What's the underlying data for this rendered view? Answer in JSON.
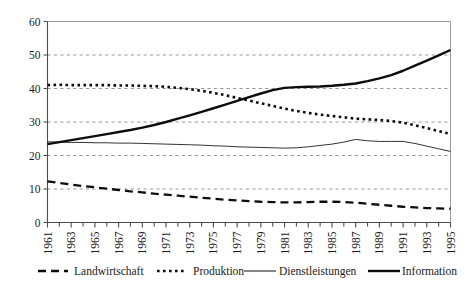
{
  "chart_data": {
    "type": "line",
    "title": "",
    "subtitle": "",
    "xlabel": "",
    "ylabel": "",
    "xlim": [
      1961,
      1995
    ],
    "ylim": [
      0,
      60
    ],
    "yticks": [
      0,
      10,
      20,
      30,
      40,
      50,
      60
    ],
    "grid": true,
    "legend_position": "bottom",
    "x": [
      1961,
      1962,
      1963,
      1964,
      1965,
      1966,
      1967,
      1968,
      1969,
      1970,
      1971,
      1972,
      1973,
      1974,
      1975,
      1976,
      1977,
      1978,
      1979,
      1980,
      1981,
      1982,
      1983,
      1984,
      1985,
      1986,
      1987,
      1988,
      1989,
      1990,
      1991,
      1992,
      1993,
      1994,
      1995
    ],
    "xtick_labels": [
      "1961",
      "1963",
      "1965",
      "1967",
      "1969",
      "1971",
      "1973",
      "1975",
      "1977",
      "1979",
      "1981",
      "1983",
      "1985",
      "1987",
      "1989",
      "1991",
      "1993",
      "1995"
    ],
    "series": [
      {
        "name": "Landwirtschaft",
        "style": "dashed",
        "values": [
          12.3,
          11.8,
          11.3,
          10.9,
          10.5,
          10.1,
          9.7,
          9.3,
          9.0,
          8.6,
          8.3,
          8.0,
          7.7,
          7.4,
          7.1,
          6.8,
          6.6,
          6.4,
          6.2,
          6.1,
          6.0,
          6.0,
          6.1,
          6.2,
          6.2,
          6.1,
          5.9,
          5.6,
          5.3,
          5.0,
          4.7,
          4.5,
          4.3,
          4.2,
          4.1
        ]
      },
      {
        "name": "Produktion",
        "style": "dotted",
        "values": [
          41.0,
          41.1,
          41.0,
          41.0,
          41.0,
          41.0,
          40.9,
          40.9,
          40.8,
          40.7,
          40.5,
          40.2,
          39.8,
          39.3,
          38.7,
          38.0,
          37.2,
          36.4,
          35.6,
          34.8,
          34.0,
          33.3,
          32.7,
          32.2,
          31.8,
          31.4,
          31.0,
          30.8,
          30.6,
          30.3,
          29.8,
          29.0,
          28.2,
          27.3,
          26.4
        ]
      },
      {
        "name": "Dienstleistungen",
        "style": "thin-solid",
        "values": [
          24.1,
          24.0,
          23.9,
          23.9,
          23.8,
          23.8,
          23.7,
          23.7,
          23.6,
          23.5,
          23.4,
          23.3,
          23.2,
          23.1,
          22.9,
          22.8,
          22.6,
          22.5,
          22.4,
          22.3,
          22.2,
          22.3,
          22.6,
          23.0,
          23.4,
          24.0,
          24.8,
          24.4,
          24.2,
          24.2,
          24.2,
          23.6,
          22.8,
          22.0,
          21.2
        ]
      },
      {
        "name": "Information",
        "style": "thick-solid",
        "values": [
          23.4,
          24.0,
          24.6,
          25.2,
          25.8,
          26.4,
          27.0,
          27.6,
          28.3,
          29.1,
          30.0,
          31.0,
          32.0,
          33.0,
          34.1,
          35.2,
          36.3,
          37.4,
          38.5,
          39.5,
          40.2,
          40.4,
          40.5,
          40.6,
          40.8,
          41.1,
          41.5,
          42.2,
          43.0,
          44.0,
          45.3,
          46.8,
          48.3,
          49.9,
          51.5
        ]
      }
    ]
  },
  "legend": {
    "items": [
      {
        "label": "Landwirtschaft"
      },
      {
        "label": "Produktion"
      },
      {
        "label": "Dienstleistungen"
      },
      {
        "label": "Information"
      }
    ]
  }
}
